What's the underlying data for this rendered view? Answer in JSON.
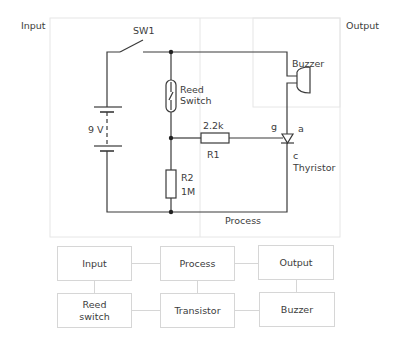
{
  "regions": {
    "input_label": "Input",
    "output_label": "Output",
    "process_label": "Process"
  },
  "circuit": {
    "switch_label": "SW1",
    "battery_label": "9 V",
    "reed_switch_label": "Reed\nSwitch",
    "r1_value": "2.2k",
    "r1_label": "R1",
    "r2_label": "R2",
    "r2_value": "1M",
    "buzzer_label": "Buzzer",
    "thyristor_gate": "g",
    "thyristor_anode": "a",
    "thyristor_cathode": "c",
    "thyristor_label": "Thyristor"
  },
  "block_diagram": {
    "top_row": [
      "Input",
      "Process",
      "Output"
    ],
    "bottom_row": [
      "Reed\nswitch",
      "Transistor",
      "Buzzer"
    ]
  },
  "colors": {
    "wire": "#3a3a3a",
    "region_border": "#e4e4e4",
    "block_border": "#d6d6d6"
  }
}
